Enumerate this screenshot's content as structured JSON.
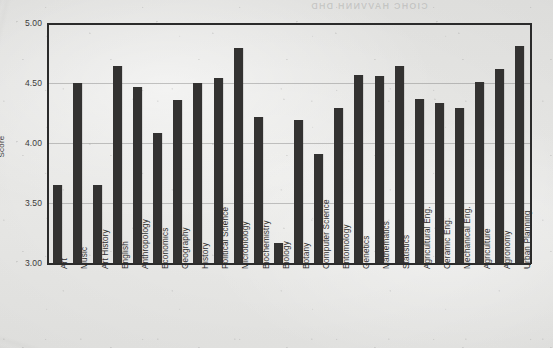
{
  "showthrough_text": "CIOHC HAVVNNH DHD",
  "chart_data": {
    "type": "bar",
    "title": "",
    "xlabel": "",
    "ylabel": "Score",
    "ylim": [
      3.0,
      5.0
    ],
    "ytick_labels": [
      "5.00",
      "4.50",
      "4.00",
      "3.50",
      "3.00"
    ],
    "ytick_values": [
      5.0,
      4.5,
      4.0,
      3.5,
      3.0
    ],
    "grid": true,
    "legend": "none",
    "bar_color": "#333231",
    "categories": [
      "Art",
      "Music",
      "Art History",
      "English",
      "Anthropology",
      "Economics",
      "Geography",
      "History",
      "Political Science",
      "Microbiology",
      "Biochemistry",
      "Biology",
      "Botany",
      "Computer Science",
      "Entomology",
      "Genetics",
      "Mathematics",
      "Statistics",
      "Agricultural Eng.",
      "Ceramic Eng.",
      "Mechanical Eng.",
      "Agriculture",
      "Agronomy",
      "Urban Planning"
    ],
    "values": [
      3.65,
      4.5,
      3.65,
      4.64,
      4.47,
      4.08,
      4.36,
      4.5,
      4.54,
      4.79,
      4.22,
      3.17,
      4.19,
      3.91,
      4.29,
      4.57,
      4.56,
      4.64,
      4.37,
      4.33,
      4.29,
      4.51,
      4.62,
      4.81
    ]
  }
}
